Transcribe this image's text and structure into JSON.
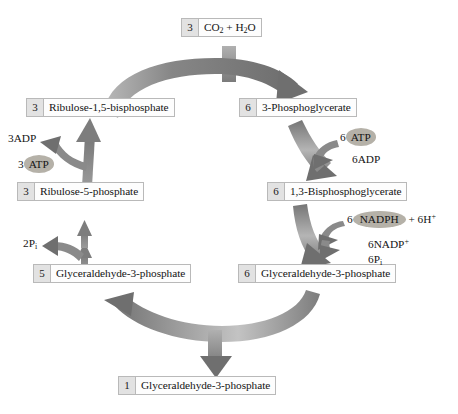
{
  "diagram": {
    "type": "cycle-diagram",
    "background_color": "#ffffff",
    "arrow_color": "#6f6f6f",
    "arrow_color_light": "#bdbdbd",
    "box_border_color": "#b9b9b9",
    "box_fill_color": "#fdfdfd",
    "count_cell_fill": "#e2e2e2",
    "pill_fill": "#b5b1a8"
  },
  "nodes": [
    {
      "id": "co2-water",
      "count": "3",
      "label": "CO2 + H2O",
      "label_html": "CO<sub>2</sub> + H<sub>2</sub>O",
      "position": "top"
    },
    {
      "id": "ribulose-1-5-bisphosphate",
      "count": "3",
      "label": "Ribulose-1,5-bisphosphate",
      "label_html": "Ribulose-1,5-bisphosphate",
      "position": "upper-left"
    },
    {
      "id": "3-phosphoglycerate",
      "count": "6",
      "label": "3-Phosphoglycerate",
      "label_html": "3-Phosphoglycerate",
      "position": "upper-right"
    },
    {
      "id": "ribulose-5-phosphate",
      "count": "3",
      "label": "Ribulose-5-phosphate",
      "label_html": "Ribulose-5-phosphate",
      "position": "mid-left"
    },
    {
      "id": "1-3-bisphosphoglycerate",
      "count": "6",
      "label": "1,3-Bisphosphoglycerate",
      "label_html": "1,3-Bisphosphoglycerate",
      "position": "mid-right"
    },
    {
      "id": "glyceraldehyde-3-phosphate-5",
      "count": "5",
      "label": "Glyceraldehyde-3-phosphate",
      "label_html": "Glyceraldehyde-3-phosphate",
      "position": "lower-left"
    },
    {
      "id": "glyceraldehyde-3-phosphate-6",
      "count": "6",
      "label": "Glyceraldehyde-3-phosphate",
      "label_html": "Glyceraldehyde-3-phosphate",
      "position": "lower-right"
    },
    {
      "id": "glyceraldehyde-3-phosphate-1",
      "count": "1",
      "label": "Glyceraldehyde-3-phosphate",
      "label_html": "Glyceraldehyde-3-phosphate",
      "position": "bottom"
    }
  ],
  "cofactors": [
    {
      "id": "3adp",
      "text": "3ADP",
      "text_html": "3ADP",
      "highlighted": false,
      "side": "left"
    },
    {
      "id": "3atp",
      "text": "3 ATP",
      "prefix": "3",
      "pill_text": "ATP",
      "highlighted": true,
      "side": "left"
    },
    {
      "id": "2pi",
      "text": "2Pi",
      "text_html": "2P<sub>i</sub>",
      "highlighted": false,
      "side": "left"
    },
    {
      "id": "6atp",
      "text": "6 ATP",
      "prefix": "6",
      "pill_text": "ATP",
      "highlighted": true,
      "side": "right"
    },
    {
      "id": "6adp",
      "text": "6ADP",
      "text_html": "6ADP",
      "highlighted": false,
      "side": "right"
    },
    {
      "id": "6nadph",
      "text": "6 NADPH + 6H+",
      "prefix": "6",
      "pill_text": "NADPH",
      "suffix_html": " + 6H<sup>+</sup>",
      "highlighted": true,
      "side": "right"
    },
    {
      "id": "6nadp",
      "text": "6NADP+",
      "text_html": "6NADP<sup>+</sup>",
      "highlighted": false,
      "side": "right"
    },
    {
      "id": "6pi",
      "text": "6Pi",
      "text_html": "6P<sub>i</sub>",
      "highlighted": false,
      "side": "right"
    }
  ]
}
